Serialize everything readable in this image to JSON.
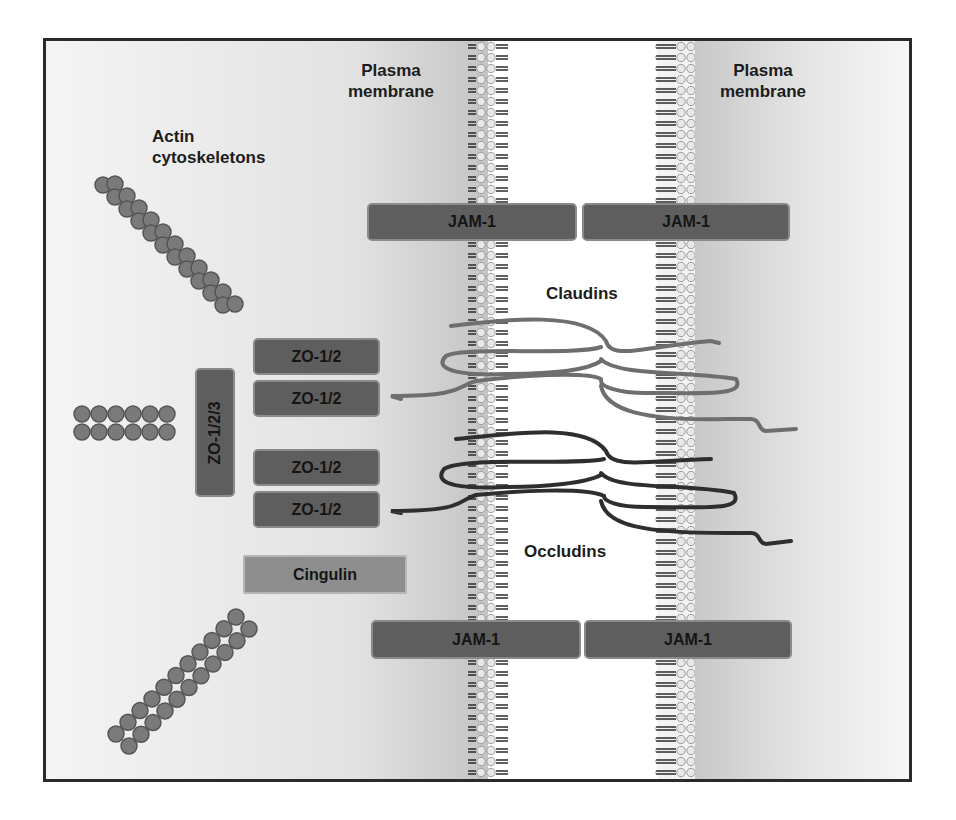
{
  "diagram": {
    "labels": {
      "actin": [
        "Actin",
        "cytoskeletons"
      ],
      "plasma_membrane_left": [
        "Plasma",
        "membrane"
      ],
      "plasma_membrane_right": [
        "Plasma",
        "membrane"
      ],
      "claudins": "Claudins",
      "occludins": "Occludins"
    },
    "proteins": {
      "jam_top": [
        "JAM-1",
        "JAM-1"
      ],
      "jam_bottom": [
        "JAM-1",
        "JAM-1"
      ],
      "zo12": [
        "ZO-1/2",
        "ZO-1/2",
        "ZO-1/2",
        "ZO-1/2"
      ],
      "zo123": "ZO-1/2/3",
      "cingulin": "Cingulin"
    },
    "colors": {
      "protein_box": "#5e5e5e",
      "cingulin_box": "#8e8e8e",
      "actin_bead": "#7a7a7a",
      "claudin_strand": "#6e6e6e",
      "occludin_strand": "#2e2e2e",
      "frame_border": "#2a2a2a"
    }
  }
}
